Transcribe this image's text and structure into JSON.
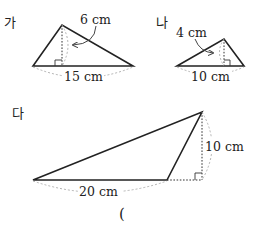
{
  "figures": [
    {
      "label": "가",
      "base": "15 cm",
      "height": "6 cm"
    },
    {
      "label": "나",
      "base": "10 cm",
      "height": "4 cm"
    },
    {
      "label": "다",
      "base": "20 cm",
      "height": "10 cm"
    }
  ],
  "answer_blank": "("
}
